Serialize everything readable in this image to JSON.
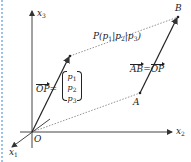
{
  "figure": {
    "axes": {
      "x1": {
        "label": "x",
        "sub": "1"
      },
      "x2": {
        "label": "x",
        "sub": "2"
      },
      "x3": {
        "label": "x",
        "sub": "3"
      }
    },
    "points": {
      "origin": "O",
      "A": "A",
      "B": "B",
      "P": {
        "name": "P",
        "coords": [
          "p",
          "p",
          "p"
        ],
        "subs": [
          "1",
          "2",
          "3"
        ],
        "separator": "|"
      }
    },
    "labels": {
      "op_vector": "OP",
      "equals": "=",
      "ab_vector": "AB",
      "op_vector_right": "OP",
      "column": [
        "p",
        "p",
        "p"
      ],
      "column_subs": [
        "1",
        "2",
        "3"
      ]
    },
    "colors": {
      "line": "#333333",
      "dotted": "#666666",
      "border": "#9ec3e6"
    }
  }
}
